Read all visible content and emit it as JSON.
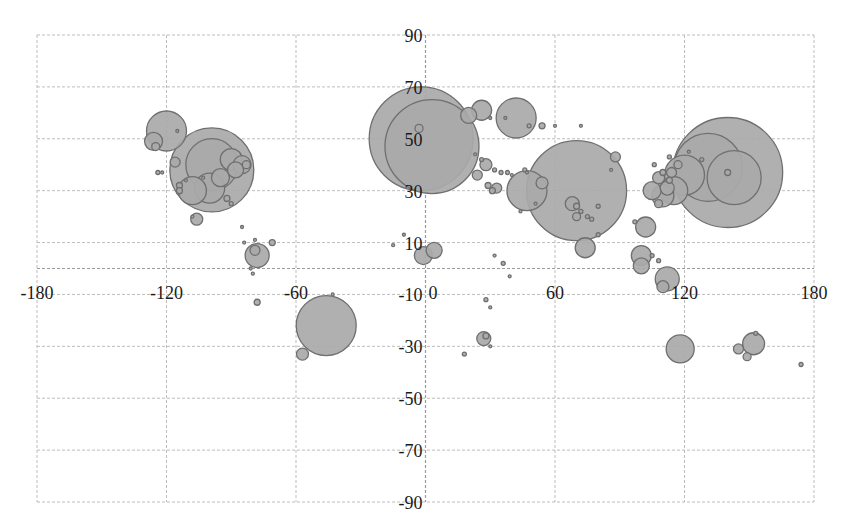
{
  "chart_data": {
    "type": "bubble",
    "title": "",
    "xlabel": "",
    "ylabel": "",
    "xlim": [
      -180,
      180
    ],
    "ylim": [
      -90,
      90
    ],
    "x_ticks": [
      -180,
      -120,
      -60,
      0,
      60,
      120,
      180
    ],
    "y_ticks": [
      90,
      70,
      50,
      30,
      10,
      -10,
      -30,
      -50,
      -70,
      -90
    ],
    "grid": true,
    "legend": "none",
    "colors": {
      "fill": "#a9a9a9",
      "stroke": "#6f6f6f",
      "grid": "#bdbdbd"
    },
    "series": [
      {
        "name": "bubbles",
        "points_note": "each point: [longitude (x), latitude (y), bubble radius in px]",
        "points": [
          [
            -120,
            53,
            20
          ],
          [
            -126,
            49,
            9
          ],
          [
            -125,
            47,
            4
          ],
          [
            -115,
            53,
            1.5
          ],
          [
            -116,
            41,
            5
          ],
          [
            -124,
            37,
            2
          ],
          [
            -111,
            34,
            1.5
          ],
          [
            -122,
            37,
            1.5
          ],
          [
            -99,
            38,
            42
          ],
          [
            -99,
            40,
            26
          ],
          [
            -100,
            31,
            15
          ],
          [
            -95,
            35,
            9
          ],
          [
            -90,
            42,
            11
          ],
          [
            -85,
            40,
            9
          ],
          [
            -88,
            38,
            8
          ],
          [
            -83,
            40,
            4
          ],
          [
            -92,
            27,
            3
          ],
          [
            -90,
            25,
            2
          ],
          [
            -108,
            30,
            14
          ],
          [
            -114,
            32,
            3
          ],
          [
            -114,
            30,
            3
          ],
          [
            -106,
            19,
            6
          ],
          [
            -108,
            20,
            1.5
          ],
          [
            -103,
            35,
            1.5
          ],
          [
            -85,
            16,
            1.5
          ],
          [
            -78,
            5,
            12
          ],
          [
            -79,
            7,
            5
          ],
          [
            -71,
            10,
            3
          ],
          [
            -84,
            10,
            1.5
          ],
          [
            -79,
            11,
            1.5
          ],
          [
            -80,
            -2,
            1.5
          ],
          [
            -81,
            0,
            1.5
          ],
          [
            -78,
            -13,
            3
          ],
          [
            -46,
            -22,
            30
          ],
          [
            -57,
            -33,
            6
          ],
          [
            -43,
            -10,
            1.5
          ],
          [
            -2,
            50,
            52
          ],
          [
            3,
            47,
            47
          ],
          [
            -3,
            54,
            4
          ],
          [
            20,
            59,
            8
          ],
          [
            26,
            61,
            10
          ],
          [
            42,
            58,
            20
          ],
          [
            37,
            58,
            1.5
          ],
          [
            30,
            58,
            1.5
          ],
          [
            48,
            55,
            2
          ],
          [
            54,
            55,
            3
          ],
          [
            60,
            55,
            1.5
          ],
          [
            72,
            55,
            1.5
          ],
          [
            23,
            44,
            1.5
          ],
          [
            26,
            42,
            2
          ],
          [
            28,
            40,
            6
          ],
          [
            24,
            36,
            5
          ],
          [
            32,
            38,
            2
          ],
          [
            35,
            37,
            2
          ],
          [
            38,
            37,
            2
          ],
          [
            40,
            36,
            1.5
          ],
          [
            29,
            32,
            3
          ],
          [
            31,
            30,
            3
          ],
          [
            33,
            31,
            5
          ],
          [
            46,
            38,
            2
          ],
          [
            47,
            37,
            1.5
          ],
          [
            47,
            30,
            20
          ],
          [
            54,
            33,
            6
          ],
          [
            51,
            25,
            1.5
          ],
          [
            44,
            22,
            1.5
          ],
          [
            -10,
            13,
            1.5
          ],
          [
            -15,
            9,
            1.5
          ],
          [
            4,
            7,
            8
          ],
          [
            -1,
            5,
            9
          ],
          [
            36,
            2,
            2
          ],
          [
            32,
            5,
            1.5
          ],
          [
            39,
            -3,
            1.5
          ],
          [
            28,
            -12,
            2
          ],
          [
            30,
            -15,
            1.5
          ],
          [
            27,
            -27,
            7
          ],
          [
            28,
            -26,
            3
          ],
          [
            30,
            -30,
            1.5
          ],
          [
            18,
            -33,
            2
          ],
          [
            70,
            30,
            50
          ],
          [
            68,
            25,
            7
          ],
          [
            70,
            20,
            4
          ],
          [
            70,
            24,
            3
          ],
          [
            75,
            20,
            2
          ],
          [
            77,
            19,
            2
          ],
          [
            80,
            24,
            2
          ],
          [
            72,
            22,
            2
          ],
          [
            80,
            13,
            2
          ],
          [
            74,
            8,
            10
          ],
          [
            86,
            38,
            1.5
          ],
          [
            88,
            43,
            5
          ],
          [
            100,
            5,
            10
          ],
          [
            100,
            1,
            8
          ],
          [
            108,
            3,
            2
          ],
          [
            102,
            16,
            10
          ],
          [
            97,
            18,
            2
          ],
          [
            108,
            25,
            4
          ],
          [
            115,
            30,
            14
          ],
          [
            110,
            28,
            11
          ],
          [
            112,
            31,
            7
          ],
          [
            105,
            30,
            9
          ],
          [
            108,
            35,
            6
          ],
          [
            114,
            37,
            5
          ],
          [
            117,
            40,
            4
          ],
          [
            110,
            37,
            3
          ],
          [
            106,
            40,
            2
          ],
          [
            113,
            34,
            3
          ],
          [
            120,
            36,
            20
          ],
          [
            113,
            43,
            2
          ],
          [
            112,
            -4,
            12
          ],
          [
            110,
            -7,
            6
          ],
          [
            118,
            -31,
            14
          ],
          [
            105,
            5,
            2
          ],
          [
            140,
            37,
            55
          ],
          [
            131,
            39,
            34
          ],
          [
            143,
            35,
            27
          ],
          [
            140,
            37,
            3
          ],
          [
            128,
            42,
            2
          ],
          [
            122,
            45,
            1.5
          ],
          [
            145,
            -31,
            5
          ],
          [
            149,
            -34,
            4
          ],
          [
            152,
            -29,
            11
          ],
          [
            153,
            -25,
            2
          ],
          [
            174,
            -37,
            2
          ]
        ]
      }
    ]
  }
}
